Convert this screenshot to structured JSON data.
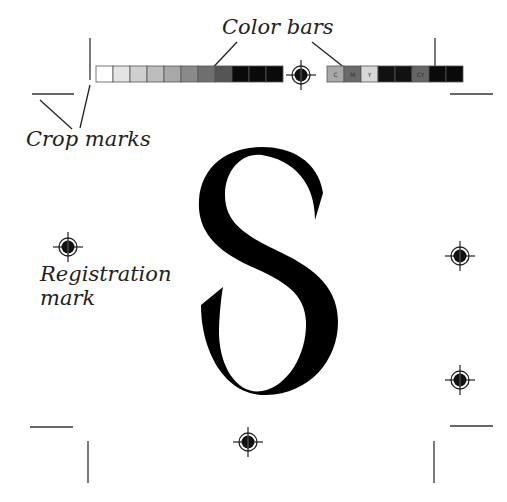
{
  "labels": {
    "color_bars": "Color bars",
    "crop_marks": "Crop marks",
    "registration_line1": "Registration",
    "registration_line2": "mark"
  },
  "glyph": "S",
  "color_bar_left": {
    "swatches": [
      "#ffffff",
      "#e4e4e4",
      "#cfcfcf",
      "#bdbdbd",
      "#a8a8a8",
      "#8a8a8a",
      "#6f6f6f",
      "#555555",
      "#0a0a0a",
      "#0a0a0a",
      "#0a0a0a"
    ]
  },
  "color_bar_right": {
    "swatches": [
      {
        "color": "#a8a8a8",
        "text": "C"
      },
      {
        "color": "#6a6a6a",
        "text": "M"
      },
      {
        "color": "#d8d8d8",
        "text": "Y"
      },
      {
        "color": "#111111",
        "text": ""
      },
      {
        "color": "#111111",
        "text": ""
      },
      {
        "color": "#666666",
        "text": "CY"
      },
      {
        "color": "#0a0a0a",
        "text": ""
      },
      {
        "color": "#0a0a0a",
        "text": ""
      }
    ]
  }
}
